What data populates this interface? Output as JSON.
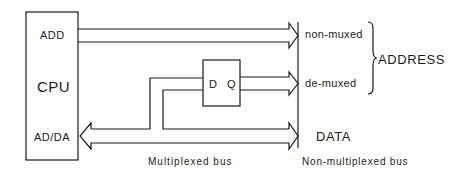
{
  "diagram": {
    "type": "block-diagram",
    "cpu": {
      "name": "CPU",
      "ports": {
        "add": "ADD",
        "adda": "AD/DA"
      }
    },
    "latch": {
      "input_label": "D",
      "output_label": "Q"
    },
    "outputs": {
      "non_muxed": "non-muxed",
      "de_muxed": "de-muxed",
      "address_group": "ADDRESS",
      "data": "DATA"
    },
    "captions": {
      "multiplexed_bus": "Multiplexed bus",
      "non_multiplexed_bus": "Non-multiplexed bus"
    },
    "connections": [
      {
        "from": "ADD",
        "to": "non-muxed",
        "style": "bus-arrow"
      },
      {
        "from": "AD/DA",
        "to": "D",
        "style": "bus-line"
      },
      {
        "from": "Q",
        "to": "de-muxed",
        "style": "bus-arrow"
      },
      {
        "from": "AD/DA",
        "to": "DATA",
        "style": "bidirectional-bus-arrow"
      }
    ],
    "colors": {
      "line": "#1a1a1a",
      "background": "#ffffff"
    }
  }
}
